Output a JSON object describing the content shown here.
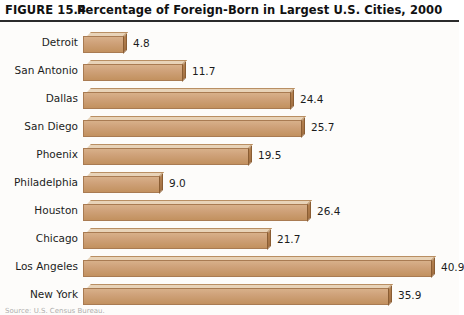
{
  "header": {
    "figure_number": "FIGURE 15.4",
    "title": "Percentage of Foreign-Born in Largest U.S. Cities, 2000"
  },
  "source_note": "Source: U.S. Census Bureau.",
  "colors": {
    "bar_face": "#cfa27a",
    "bar_top": "#e8d3b8",
    "bar_side": "#a06f42",
    "rule": "#2b2b2b",
    "background": "#fdfcfa",
    "text": "#1c1c1c"
  },
  "chart_data": {
    "type": "bar",
    "orientation": "horizontal",
    "title": "Percentage of Foreign-Born in Largest U.S. Cities, 2000",
    "xlabel": "",
    "ylabel": "",
    "xlim": [
      0,
      44
    ],
    "grid": false,
    "legend": null,
    "value_labels": true,
    "categories": [
      "Detroit",
      "San Antonio",
      "Dallas",
      "San Diego",
      "Phoenix",
      "Philadelphia",
      "Houston",
      "Chicago",
      "Los Angeles",
      "New York"
    ],
    "values": [
      4.8,
      11.7,
      24.4,
      25.7,
      19.5,
      9.0,
      26.4,
      21.7,
      40.9,
      35.9
    ],
    "value_text": [
      "4.8",
      "11.7",
      "24.4",
      "25.7",
      "19.5",
      "9.0",
      "26.4",
      "21.7",
      "40.9",
      "35.9"
    ]
  }
}
